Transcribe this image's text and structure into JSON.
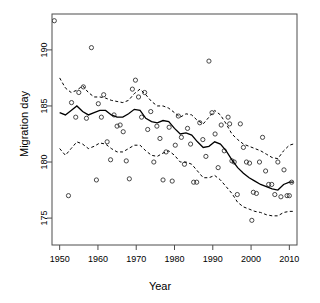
{
  "chart_data": {
    "type": "scatter",
    "title": "",
    "xlabel": "Year",
    "ylabel": "Migration day",
    "xlim": [
      1948,
      2012
    ],
    "ylim": [
      172.6,
      193.2
    ],
    "xticks": [
      1950,
      1960,
      1970,
      1980,
      1990,
      2000,
      2010
    ],
    "yticks": [
      175,
      180,
      185,
      190
    ],
    "grid": false,
    "legend": null,
    "box": true,
    "point_marker": "open-circle",
    "series": [
      {
        "name": "Observed migration day",
        "type": "scatter",
        "marker": "open-circle",
        "color": "#333333",
        "points": [
          [
            1948.6,
            192.6
          ],
          [
            1952.3,
            177.0
          ],
          [
            1953.1,
            185.3
          ],
          [
            1954.2,
            184.0
          ],
          [
            1955.0,
            186.2
          ],
          [
            1956.2,
            186.7
          ],
          [
            1957.0,
            183.9
          ],
          [
            1958.3,
            190.2
          ],
          [
            1959.6,
            178.4
          ],
          [
            1960.1,
            185.2
          ],
          [
            1960.9,
            184.0
          ],
          [
            1961.5,
            186.0
          ],
          [
            1962.4,
            181.8
          ],
          [
            1963.3,
            180.2
          ],
          [
            1964.2,
            184.2
          ],
          [
            1965.0,
            183.2
          ],
          [
            1965.8,
            183.3
          ],
          [
            1966.6,
            182.7
          ],
          [
            1967.4,
            180.1
          ],
          [
            1968.2,
            178.5
          ],
          [
            1969.0,
            186.5
          ],
          [
            1969.8,
            187.3
          ],
          [
            1970.6,
            185.8
          ],
          [
            1971.4,
            184.0
          ],
          [
            1972.2,
            186.2
          ],
          [
            1973.0,
            182.9
          ],
          [
            1973.8,
            184.5
          ],
          [
            1974.6,
            180.0
          ],
          [
            1975.4,
            183.2
          ],
          [
            1976.2,
            182.1
          ],
          [
            1977.0,
            178.4
          ],
          [
            1977.8,
            180.9
          ],
          [
            1978.6,
            183.1
          ],
          [
            1979.4,
            178.3
          ],
          [
            1980.2,
            181.5
          ],
          [
            1981.0,
            184.1
          ],
          [
            1981.8,
            182.2
          ],
          [
            1982.6,
            179.8
          ],
          [
            1983.4,
            183.0
          ],
          [
            1984.2,
            181.6
          ],
          [
            1985.0,
            178.2
          ],
          [
            1985.8,
            178.2
          ],
          [
            1986.6,
            183.5
          ],
          [
            1987.4,
            182.0
          ],
          [
            1988.2,
            180.5
          ],
          [
            1989.0,
            189.0
          ],
          [
            1989.8,
            184.4
          ],
          [
            1990.6,
            182.5
          ],
          [
            1991.4,
            179.5
          ],
          [
            1992.2,
            183.3
          ],
          [
            1993.0,
            181.0
          ],
          [
            1994.0,
            184.0
          ],
          [
            1994.4,
            183.4
          ],
          [
            1995.0,
            180.1
          ],
          [
            1995.6,
            180.0
          ],
          [
            1996.4,
            177.1
          ],
          [
            1997.2,
            183.4
          ],
          [
            1998.0,
            181.3
          ],
          [
            1998.8,
            180.0
          ],
          [
            1999.6,
            179.9
          ],
          [
            2000.2,
            174.8
          ],
          [
            2000.6,
            177.3
          ],
          [
            2001.4,
            177.2
          ],
          [
            2002.2,
            180.0
          ],
          [
            2003.0,
            182.2
          ],
          [
            2003.8,
            179.2
          ],
          [
            2004.6,
            178.0
          ],
          [
            2005.4,
            178.0
          ],
          [
            2006.2,
            177.1
          ],
          [
            2007.0,
            180.0
          ],
          [
            2007.8,
            176.9
          ],
          [
            2008.6,
            179.3
          ],
          [
            2009.4,
            177.0
          ],
          [
            2010.0,
            177.0
          ],
          [
            2010.6,
            178.2
          ]
        ]
      },
      {
        "name": "Fitted trend",
        "type": "line",
        "style": "solid",
        "color": "#000000",
        "points": [
          [
            1950.0,
            184.4
          ],
          [
            1951.5,
            184.2
          ],
          [
            1953.0,
            184.6
          ],
          [
            1954.5,
            185.0
          ],
          [
            1956.0,
            184.5
          ],
          [
            1957.5,
            184.2
          ],
          [
            1959.0,
            184.4
          ],
          [
            1960.5,
            184.6
          ],
          [
            1962.0,
            184.6
          ],
          [
            1963.5,
            184.2
          ],
          [
            1965.0,
            184.0
          ],
          [
            1966.5,
            184.0
          ],
          [
            1968.0,
            184.3
          ],
          [
            1969.5,
            184.7
          ],
          [
            1971.0,
            184.6
          ],
          [
            1972.5,
            183.9
          ],
          [
            1974.0,
            183.6
          ],
          [
            1975.5,
            183.5
          ],
          [
            1977.0,
            183.7
          ],
          [
            1978.5,
            183.6
          ],
          [
            1980.0,
            183.0
          ],
          [
            1981.5,
            182.5
          ],
          [
            1983.0,
            182.6
          ],
          [
            1984.5,
            182.4
          ],
          [
            1986.0,
            181.8
          ],
          [
            1987.5,
            181.3
          ],
          [
            1989.0,
            181.4
          ],
          [
            1990.5,
            181.8
          ],
          [
            1992.0,
            181.6
          ],
          [
            1993.5,
            181.0
          ],
          [
            1995.0,
            180.2
          ],
          [
            1996.5,
            179.5
          ],
          [
            1998.0,
            179.0
          ],
          [
            1999.5,
            178.6
          ],
          [
            2001.0,
            178.3
          ],
          [
            2002.5,
            178.0
          ],
          [
            2004.0,
            177.8
          ],
          [
            2005.5,
            177.6
          ],
          [
            2007.0,
            177.5
          ],
          [
            2008.5,
            178.0
          ],
          [
            2010.0,
            178.2
          ],
          [
            2011.0,
            178.2
          ]
        ]
      },
      {
        "name": "Upper confidence band",
        "type": "line",
        "style": "dashed",
        "color": "#000000",
        "points": [
          [
            1950.0,
            187.5
          ],
          [
            1951.5,
            186.6
          ],
          [
            1953.0,
            186.2
          ],
          [
            1954.5,
            186.4
          ],
          [
            1956.0,
            186.8
          ],
          [
            1957.5,
            186.2
          ],
          [
            1959.0,
            185.8
          ],
          [
            1960.5,
            185.8
          ],
          [
            1962.0,
            185.7
          ],
          [
            1963.5,
            185.5
          ],
          [
            1965.0,
            185.4
          ],
          [
            1966.5,
            185.3
          ],
          [
            1968.0,
            185.5
          ],
          [
            1969.5,
            186.1
          ],
          [
            1971.0,
            186.5
          ],
          [
            1972.5,
            186.0
          ],
          [
            1974.0,
            185.4
          ],
          [
            1975.5,
            185.0
          ],
          [
            1977.0,
            185.0
          ],
          [
            1978.5,
            184.8
          ],
          [
            1980.0,
            184.4
          ],
          [
            1981.5,
            184.0
          ],
          [
            1983.0,
            184.3
          ],
          [
            1984.5,
            184.2
          ],
          [
            1986.0,
            183.7
          ],
          [
            1987.5,
            183.4
          ],
          [
            1989.0,
            184.0
          ],
          [
            1990.5,
            184.6
          ],
          [
            1992.0,
            184.2
          ],
          [
            1993.5,
            183.4
          ],
          [
            1995.0,
            182.5
          ],
          [
            1996.5,
            182.0
          ],
          [
            1998.0,
            181.6
          ],
          [
            1999.5,
            181.4
          ],
          [
            2001.0,
            181.2
          ],
          [
            2002.5,
            181.0
          ],
          [
            2004.0,
            180.7
          ],
          [
            2005.5,
            180.4
          ],
          [
            2007.0,
            180.3
          ],
          [
            2008.5,
            181.0
          ],
          [
            2010.0,
            181.5
          ],
          [
            2011.0,
            181.6
          ]
        ]
      },
      {
        "name": "Lower confidence band",
        "type": "line",
        "style": "dashed",
        "color": "#000000",
        "points": [
          [
            1950.0,
            181.2
          ],
          [
            1951.5,
            180.6
          ],
          [
            1953.0,
            181.2
          ],
          [
            1954.5,
            181.8
          ],
          [
            1956.0,
            181.6
          ],
          [
            1957.5,
            181.2
          ],
          [
            1959.0,
            181.4
          ],
          [
            1960.5,
            181.7
          ],
          [
            1962.0,
            181.6
          ],
          [
            1963.5,
            181.2
          ],
          [
            1965.0,
            180.9
          ],
          [
            1966.5,
            180.9
          ],
          [
            1968.0,
            181.2
          ],
          [
            1969.5,
            181.5
          ],
          [
            1971.0,
            181.5
          ],
          [
            1972.5,
            181.0
          ],
          [
            1974.0,
            180.6
          ],
          [
            1975.5,
            180.5
          ],
          [
            1977.0,
            180.8
          ],
          [
            1978.5,
            181.0
          ],
          [
            1980.0,
            180.6
          ],
          [
            1981.5,
            180.0
          ],
          [
            1983.0,
            180.0
          ],
          [
            1984.5,
            179.8
          ],
          [
            1986.0,
            179.2
          ],
          [
            1987.5,
            178.6
          ],
          [
            1989.0,
            178.6
          ],
          [
            1990.5,
            178.8
          ],
          [
            1992.0,
            178.4
          ],
          [
            1993.5,
            177.8
          ],
          [
            1995.0,
            177.2
          ],
          [
            1996.5,
            176.4
          ],
          [
            1998.0,
            176.0
          ],
          [
            1999.5,
            175.8
          ],
          [
            2001.0,
            175.6
          ],
          [
            2002.5,
            175.5
          ],
          [
            2004.0,
            175.3
          ],
          [
            2005.5,
            175.2
          ],
          [
            2007.0,
            175.2
          ],
          [
            2008.5,
            175.5
          ],
          [
            2010.0,
            175.6
          ],
          [
            2011.0,
            175.6
          ]
        ]
      }
    ]
  }
}
